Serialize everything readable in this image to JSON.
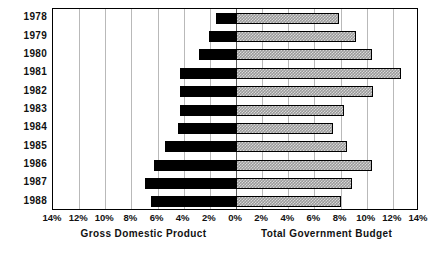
{
  "chart_data": {
    "type": "bar",
    "orientation": "horizontal-diverging",
    "title": "",
    "categories": [
      "1978",
      "1979",
      "1980",
      "1981",
      "1982",
      "1983",
      "1984",
      "1985",
      "1986",
      "1987",
      "1988"
    ],
    "series": [
      {
        "name": "Gross Domestic Product",
        "side": "left",
        "fill": "solid-black",
        "values": [
          1.5,
          2.1,
          2.8,
          4.3,
          4.3,
          4.3,
          4.4,
          5.4,
          6.3,
          7.0,
          6.5
        ]
      },
      {
        "name": "Total Government Budget",
        "side": "right",
        "fill": "hatched-gray",
        "values": [
          7.9,
          9.2,
          10.4,
          12.6,
          10.5,
          8.3,
          7.4,
          8.5,
          10.4,
          8.9,
          8.0
        ]
      }
    ],
    "xlabel_left": "Gross Domestic Product",
    "xlabel_right": "Total Government Budget",
    "ylabel": "",
    "xlim": [
      -14,
      14
    ],
    "xtick_values": [
      -14,
      -12,
      -10,
      -8,
      -6,
      -4,
      -2,
      0,
      2,
      4,
      6,
      8,
      10,
      12,
      14
    ],
    "xtick_labels": [
      "14%",
      "12%",
      "10%",
      "8%",
      "6%",
      "4%",
      "2%",
      "0%",
      "2%",
      "4%",
      "6%",
      "8%",
      "10%",
      "12%",
      "14%"
    ],
    "grid": true,
    "grid_axis": "x",
    "legend": "none",
    "colors": {
      "left_bar": "#000000",
      "right_bar": "#9a9a9a",
      "gridline": "#b9b9b9",
      "axis": "#000000",
      "text": "#111111",
      "background": "#ffffff"
    }
  }
}
